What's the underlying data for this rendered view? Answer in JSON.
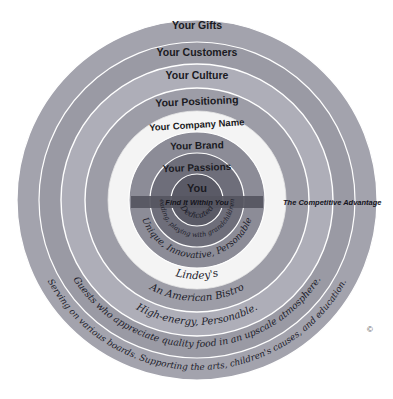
{
  "diagram": {
    "title": "The Competitive Advantage",
    "center": {
      "cx": 197,
      "cy": 200
    },
    "copyright_mark": "©",
    "competitive_advantage_label": "The Competitive Advantage",
    "center_tagline": "Find It Within You",
    "rings": [
      {
        "key": "you",
        "label": "You",
        "example": "Dedicated",
        "radius": 26,
        "color": "#5a5a66",
        "label_y": 189,
        "example_y": 213,
        "label_size": 11,
        "example_size": 8
      },
      {
        "key": "passions",
        "label": "Your Passions",
        "example": "Cooking, reading, playing with grandchildren, traveling",
        "radius": 47,
        "color": "#6e6e7a",
        "label_y": 170,
        "example_y": 232,
        "label_size": 10,
        "example_size": 6.5
      },
      {
        "key": "brand",
        "label": "Your Brand",
        "example": "Unique, Innovative, Personable",
        "radius": 68,
        "color": "#8c8c97",
        "label_y": 148,
        "example_y": 256,
        "label_size": 10,
        "example_size": 8.5
      },
      {
        "key": "company-name",
        "label": "Your Company Name",
        "example": "Lindey's",
        "radius": 89,
        "color": "#f2f2f2",
        "label_y": 128,
        "example_y": 279,
        "label_size": 9.5,
        "example_size": 10
      },
      {
        "key": "positioning",
        "label": "Your Positioning",
        "example": "An American Bistro",
        "radius": 112,
        "color": "#9d9da7",
        "label_y": 105,
        "example_y": 301,
        "label_size": 10.5,
        "example_size": 10
      },
      {
        "key": "culture",
        "label": "Your Culture",
        "example": "High-energy, Personable.",
        "radius": 136,
        "color": "#a9a9b3",
        "label_y": 79,
        "example_y": 325,
        "label_size": 10.5,
        "example_size": 10
      },
      {
        "key": "customers",
        "label": "Your Customers",
        "example": "Guests who appreciate quality food in an upscale atmosphere.",
        "radius": 158,
        "color": "#9a9aa4",
        "label_y": 56,
        "example_y": 347,
        "label_size": 10.5,
        "example_size": 9.5
      },
      {
        "key": "gifts",
        "label": "Your Gifts",
        "example": "Serving on various boards. Supporting the arts, children's causes, and education.",
        "radius": 180,
        "color": "#a3a3ad",
        "label_y": 29,
        "example_y": 370,
        "label_size": 10.5,
        "example_size": 9
      }
    ]
  }
}
